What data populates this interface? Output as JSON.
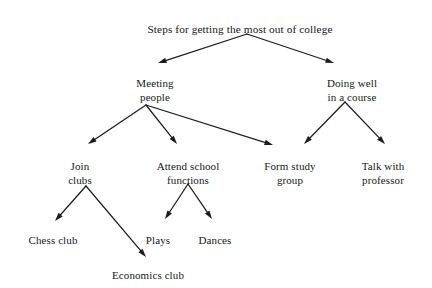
{
  "diagram": {
    "type": "tree-flowchart",
    "title": "Steps for getting the most out of college",
    "background_color": "#ffffff",
    "line_color": "#1b1d1f",
    "text_color": "#16181a",
    "nodes": [
      {
        "id": "root",
        "label": "Steps for getting the most out of college",
        "level": 0,
        "x": 240,
        "y": 22,
        "lines": [
          "Steps for getting the most out of college"
        ]
      },
      {
        "id": "meeting",
        "label": "Meeting people",
        "level": 1,
        "x": 155,
        "y": 76,
        "lines": [
          "Meeting",
          "people"
        ]
      },
      {
        "id": "course",
        "label": "Doing well in a course",
        "level": 1,
        "x": 352,
        "y": 76,
        "lines": [
          "Doing well",
          "in a course"
        ]
      },
      {
        "id": "clubs",
        "label": "Join clubs",
        "level": 2,
        "x": 80,
        "y": 159,
        "lines": [
          "Join",
          "clubs"
        ]
      },
      {
        "id": "functions",
        "label": "Attend school functions",
        "level": 2,
        "x": 188,
        "y": 159,
        "lines": [
          "Attend school",
          "functions"
        ]
      },
      {
        "id": "study",
        "label": "Form study group",
        "level": 2,
        "x": 290,
        "y": 159,
        "lines": [
          "Form study",
          "group"
        ]
      },
      {
        "id": "professor",
        "label": "Talk with professor",
        "level": 2,
        "x": 383,
        "y": 159,
        "lines": [
          "Talk with",
          "professor"
        ]
      },
      {
        "id": "chess",
        "label": "Chess club",
        "level": 3,
        "x": 53,
        "y": 233,
        "lines": [
          "Chess club"
        ]
      },
      {
        "id": "economics",
        "label": "Economics club",
        "level": 3,
        "x": 148,
        "y": 268,
        "lines": [
          "Economics club"
        ]
      },
      {
        "id": "plays",
        "label": "Plays",
        "level": 3,
        "x": 158,
        "y": 233,
        "lines": [
          "Plays"
        ]
      },
      {
        "id": "dances",
        "label": "Dances",
        "level": 3,
        "x": 215,
        "y": 233,
        "lines": [
          "Dances"
        ]
      }
    ],
    "edges": [
      {
        "from": "root",
        "to": "meeting",
        "x1": 247,
        "y1": 34,
        "x2": 158,
        "y2": 63
      },
      {
        "from": "root",
        "to": "course",
        "x1": 247,
        "y1": 34,
        "x2": 334,
        "y2": 63
      },
      {
        "from": "meeting",
        "to": "clubs",
        "x1": 146,
        "y1": 105,
        "x2": 88,
        "y2": 144
      },
      {
        "from": "meeting",
        "to": "functions",
        "x1": 146,
        "y1": 105,
        "x2": 177,
        "y2": 144
      },
      {
        "from": "meeting",
        "to": "study",
        "x1": 146,
        "y1": 105,
        "x2": 273,
        "y2": 145
      },
      {
        "from": "course",
        "to": "study",
        "x1": 345,
        "y1": 102,
        "x2": 304,
        "y2": 144
      },
      {
        "from": "course",
        "to": "professor",
        "x1": 345,
        "y1": 102,
        "x2": 385,
        "y2": 144
      },
      {
        "from": "clubs",
        "to": "chess",
        "x1": 86,
        "y1": 186,
        "x2": 55,
        "y2": 221
      },
      {
        "from": "clubs",
        "to": "economics",
        "x1": 86,
        "y1": 186,
        "x2": 146,
        "y2": 257
      },
      {
        "from": "functions",
        "to": "plays",
        "x1": 188,
        "y1": 184,
        "x2": 165,
        "y2": 219
      },
      {
        "from": "functions",
        "to": "dances",
        "x1": 188,
        "y1": 184,
        "x2": 212,
        "y2": 219
      }
    ]
  }
}
